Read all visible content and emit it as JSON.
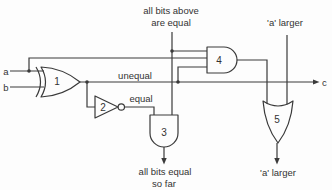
{
  "diagram": {
    "title_hint": "1-bit magnitude comparator slice",
    "colors": {
      "background": "#fdfdfd",
      "line": "#3a3a3a",
      "text": "#333333"
    },
    "inputs": {
      "a": "a",
      "b": "b"
    },
    "output": {
      "c": "c"
    },
    "gate_labels": {
      "g1": "1",
      "g2": "2",
      "g3": "3",
      "g4": "4",
      "g5": "5"
    },
    "labels": {
      "top_line1": "all bits above",
      "top_line2": "are equal",
      "a_larger_top": "'a' larger",
      "unequal": "unequal",
      "equal": "equal",
      "bottom_line1": "all bits equal",
      "bottom_line2": "so far",
      "a_larger_bottom": "'a' larger"
    }
  }
}
